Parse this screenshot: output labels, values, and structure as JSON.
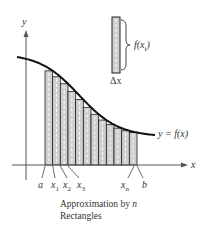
{
  "diagram": {
    "axes": {
      "x_label": "x",
      "y_label": "y"
    },
    "curve_label": "y = f(x)",
    "ticks": [
      {
        "id": "a",
        "label": "a",
        "sub": ""
      },
      {
        "id": "x1",
        "label": "x",
        "sub": "1"
      },
      {
        "id": "x2",
        "label": "x",
        "sub": "2"
      },
      {
        "id": "x3",
        "label": "x",
        "sub": "3"
      },
      {
        "id": "xn",
        "label": "x",
        "sub": "n"
      },
      {
        "id": "b",
        "label": "b",
        "sub": ""
      }
    ],
    "inset": {
      "height_label_main": "f(x",
      "height_label_sub": "i",
      "height_label_close": ")",
      "width_label": "Δx"
    },
    "caption": {
      "line1_prefix": "Approximation by ",
      "line1_var": "n",
      "line2": "Rectangles"
    },
    "rectangle_count": 12,
    "colors": {
      "rect_fill": "#cfcfcf",
      "line": "#222222",
      "axis": "#555555"
    }
  }
}
